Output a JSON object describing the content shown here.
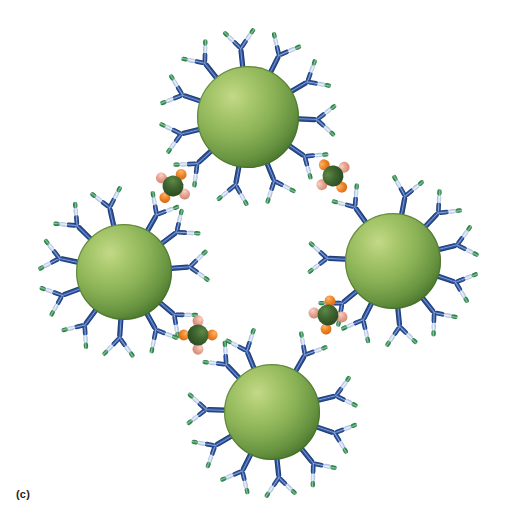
{
  "figure": {
    "panel_label": "(c)",
    "background_color": "#ffffff",
    "width": 512,
    "height": 529,
    "caption_alt": "Schematic of four antibody-coated nanoparticles cross-linked into a closed ring by multivalent antigens"
  },
  "palette": {
    "nanoparticle_highlight": "#b2cd74",
    "nanoparticle_mid": "#83ab4f",
    "nanoparticle_edge": "#4e7a2c",
    "nanoparticle_rim": "#3d6622",
    "antibody_stem_dark": "#1f3f7a",
    "antibody_stem_mid": "#2b53a0",
    "antibody_stem_light": "#6f8fc9",
    "antibody_arm_light": "#b9c9e8",
    "antibody_arm_pale": "#dfe7f5",
    "antibody_tip_green": "#2e8b4f",
    "antibody_tip_green_light": "#79b98c",
    "antigen_core_dark": "#2f5626",
    "antigen_core_light": "#527a3c",
    "antigen_node_orange": "#ef7e24",
    "antigen_node_orange_light": "#f6a85a",
    "antigen_node_salmon": "#e8a090",
    "antigen_node_salmon_light": "#f2c4b6",
    "label_color": "#231f20"
  },
  "nanoparticles": [
    {
      "id": "np-top",
      "name": "nanoparticle-top",
      "cx": 248,
      "cy": 117,
      "r": 51,
      "antibody_count": 11,
      "start_angle": -96
    },
    {
      "id": "np-left",
      "name": "nanoparticle-left",
      "cx": 124,
      "cy": 272,
      "r": 48,
      "antibody_count": 11,
      "start_angle": -168
    },
    {
      "id": "np-right",
      "name": "nanoparticle-right",
      "cx": 393,
      "cy": 261,
      "r": 48,
      "antibody_count": 11,
      "start_angle": -14
    },
    {
      "id": "np-bottom",
      "name": "nanoparticle-bottom",
      "cx": 272,
      "cy": 412,
      "r": 48,
      "antibody_count": 11,
      "start_angle": 84
    }
  ],
  "antigens": [
    {
      "id": "ag-upper-left",
      "name": "antigen-upper-left",
      "cx": 173,
      "cy": 186,
      "r": 10.5,
      "rotation": 35,
      "axis_color": "salmon"
    },
    {
      "id": "ag-upper-right",
      "name": "antigen-upper-right",
      "cx": 333,
      "cy": 176,
      "r": 10.5,
      "rotation": -38,
      "axis_color": "salmon"
    },
    {
      "id": "ag-lower-left",
      "name": "antigen-lower-left",
      "cx": 198,
      "cy": 335,
      "r": 10.5,
      "rotation": 90,
      "axis_color": "salmon"
    },
    {
      "id": "ag-lower-right",
      "name": "antigen-lower-right",
      "cx": 328,
      "cy": 315,
      "r": 10.5,
      "rotation": 8,
      "axis_color": "salmon"
    }
  ],
  "bridges": [
    {
      "id": "bridge-top-left",
      "name": "bridge-top-to-left",
      "from": "np-top",
      "to": "np-left",
      "antigen": "ag-upper-left"
    },
    {
      "id": "bridge-top-right",
      "name": "bridge-top-to-right",
      "from": "np-top",
      "to": "np-right",
      "antigen": "ag-upper-right"
    },
    {
      "id": "bridge-left-bottom",
      "name": "bridge-left-to-bottom",
      "from": "np-left",
      "to": "np-bottom",
      "antigen": "ag-lower-left"
    },
    {
      "id": "bridge-right-bottom",
      "name": "bridge-right-to-bottom",
      "from": "np-right",
      "to": "np-bottom",
      "antigen": "ag-lower-right"
    }
  ],
  "geometry": {
    "antibody_stem_length": 21,
    "antibody_arm_length": 24,
    "antibody_arm_spread_deg": 40,
    "antibody_stem_width": 5.2,
    "antibody_arm_width": 4.6
  }
}
